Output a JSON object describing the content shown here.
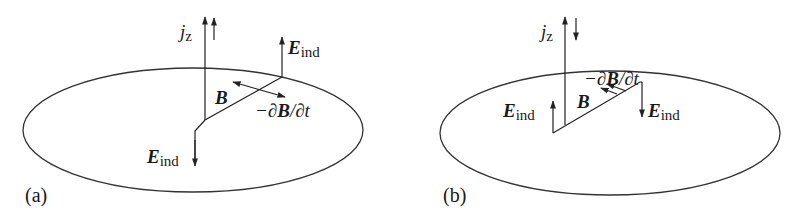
{
  "figure": {
    "type": "physics-diagram",
    "stroke_color": "#333333",
    "panels": [
      {
        "id": "a",
        "label": "(a)",
        "current_symbol": "j",
        "current_subscript": "z",
        "current_direction": "up-up",
        "field_B": "B",
        "dBdt_minus": "−∂",
        "dBdt_B": "B",
        "dBdt_tail": "/∂t",
        "E_top_main": "E",
        "E_top_sub": "ind",
        "E_top_direction": "up",
        "E_bottom_main": "E",
        "E_bottom_sub": "ind",
        "E_bottom_direction": "down"
      },
      {
        "id": "b",
        "label": "(b)",
        "current_symbol": "j",
        "current_subscript": "z",
        "current_direction": "up-down",
        "field_B": "B",
        "dBdt_minus": "−∂",
        "dBdt_B": "B",
        "dBdt_tail": "/∂t",
        "E_left_main": "E",
        "E_left_sub": "ind",
        "E_left_direction": "up",
        "E_right_main": "E",
        "E_right_sub": "ind",
        "E_right_direction": "down"
      }
    ]
  }
}
